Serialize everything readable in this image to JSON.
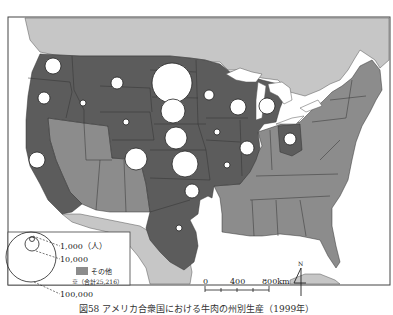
{
  "title": "図58 アメリカ合衆国における牛肉の州別生産（1999年）",
  "legend": {
    "size_labels": [
      "1,000（人）",
      "10,000",
      "100,000"
    ],
    "other_label": "その他",
    "other_note": "※（合計25,216）"
  },
  "scale_bar": {
    "labels": [
      "0",
      "400",
      "800km"
    ]
  },
  "north_arrow": {
    "label": "N"
  },
  "colors": {
    "ocean": "#ffffff",
    "canada_mexico": "#c6c6c6",
    "dark_states": "#5c5c5c",
    "other_states": "#8c8c8c",
    "circle_fill": "#ffffff",
    "border": "#333333"
  },
  "circles": [
    {
      "state": "WA",
      "cx": 53,
      "cy": 66,
      "r": 8
    },
    {
      "state": "MT",
      "cx": 117,
      "cy": 83,
      "r": 6
    },
    {
      "state": "OR",
      "cx": 44,
      "cy": 98,
      "r": 6
    },
    {
      "state": "ID",
      "cx": 83,
      "cy": 103,
      "r": 3
    },
    {
      "state": "ND-SD top",
      "cx": 172,
      "cy": 83,
      "r": 20
    },
    {
      "state": "SD",
      "cx": 173,
      "cy": 111,
      "r": 12
    },
    {
      "state": "NE",
      "cx": 176,
      "cy": 138,
      "r": 11
    },
    {
      "state": "KS",
      "cx": 185,
      "cy": 164,
      "r": 13
    },
    {
      "state": "CO",
      "cx": 136,
      "cy": 159,
      "r": 11
    },
    {
      "state": "WY",
      "cx": 126,
      "cy": 122,
      "r": 3
    },
    {
      "state": "MN",
      "cx": 209,
      "cy": 95,
      "r": 5
    },
    {
      "state": "WI",
      "cx": 238,
      "cy": 107,
      "r": 8
    },
    {
      "state": "MI",
      "cx": 267,
      "cy": 106,
      "r": 8
    },
    {
      "state": "IA",
      "cx": 217,
      "cy": 132,
      "r": 3
    },
    {
      "state": "IL",
      "cx": 247,
      "cy": 148,
      "r": 7
    },
    {
      "state": "MO",
      "cx": 227,
      "cy": 165,
      "r": 3
    },
    {
      "state": "OK",
      "cx": 192,
      "cy": 191,
      "r": 7
    },
    {
      "state": "OH",
      "cx": 290,
      "cy": 139,
      "r": 6
    },
    {
      "state": "CA",
      "cx": 37,
      "cy": 160,
      "r": 8
    },
    {
      "state": "TX",
      "cx": 179,
      "cy": 228,
      "r": 3
    }
  ]
}
